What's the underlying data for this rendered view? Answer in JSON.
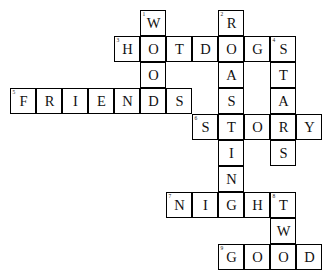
{
  "puzzle": {
    "title": "Crossword Puzzle Grid",
    "cell_size": 26,
    "origin_x": 10,
    "origin_y": 10,
    "columns": 12,
    "rows": 10,
    "colors": {
      "grid_line": "#000000",
      "cell_fill": "#ffffff",
      "letter": "#111111",
      "background": "#ffffff"
    },
    "cells": [
      {
        "row": 0,
        "col": 5,
        "letter": "W",
        "number": "1"
      },
      {
        "row": 0,
        "col": 8,
        "letter": "R",
        "number": "2"
      },
      {
        "row": 1,
        "col": 4,
        "letter": "H",
        "number": "3"
      },
      {
        "row": 1,
        "col": 5,
        "letter": "O",
        "number": ""
      },
      {
        "row": 1,
        "col": 6,
        "letter": "T",
        "number": ""
      },
      {
        "row": 1,
        "col": 7,
        "letter": "D",
        "number": ""
      },
      {
        "row": 1,
        "col": 8,
        "letter": "O",
        "number": ""
      },
      {
        "row": 1,
        "col": 9,
        "letter": "G",
        "number": ""
      },
      {
        "row": 1,
        "col": 10,
        "letter": "S",
        "number": "4"
      },
      {
        "row": 2,
        "col": 5,
        "letter": "O",
        "number": ""
      },
      {
        "row": 2,
        "col": 8,
        "letter": "A",
        "number": ""
      },
      {
        "row": 2,
        "col": 10,
        "letter": "T",
        "number": ""
      },
      {
        "row": 3,
        "col": 0,
        "letter": "F",
        "number": "5"
      },
      {
        "row": 3,
        "col": 1,
        "letter": "R",
        "number": ""
      },
      {
        "row": 3,
        "col": 2,
        "letter": "I",
        "number": ""
      },
      {
        "row": 3,
        "col": 3,
        "letter": "E",
        "number": ""
      },
      {
        "row": 3,
        "col": 4,
        "letter": "N",
        "number": ""
      },
      {
        "row": 3,
        "col": 5,
        "letter": "D",
        "number": ""
      },
      {
        "row": 3,
        "col": 6,
        "letter": "S",
        "number": ""
      },
      {
        "row": 3,
        "col": 8,
        "letter": "S",
        "number": ""
      },
      {
        "row": 3,
        "col": 10,
        "letter": "A",
        "number": ""
      },
      {
        "row": 4,
        "col": 7,
        "letter": "S",
        "number": "6"
      },
      {
        "row": 4,
        "col": 8,
        "letter": "T",
        "number": ""
      },
      {
        "row": 4,
        "col": 9,
        "letter": "O",
        "number": ""
      },
      {
        "row": 4,
        "col": 10,
        "letter": "R",
        "number": ""
      },
      {
        "row": 4,
        "col": 11,
        "letter": "Y",
        "number": ""
      },
      {
        "row": 5,
        "col": 8,
        "letter": "I",
        "number": ""
      },
      {
        "row": 5,
        "col": 10,
        "letter": "S",
        "number": ""
      },
      {
        "row": 6,
        "col": 8,
        "letter": "N",
        "number": ""
      },
      {
        "row": 7,
        "col": 6,
        "letter": "N",
        "number": "7"
      },
      {
        "row": 7,
        "col": 7,
        "letter": "I",
        "number": ""
      },
      {
        "row": 7,
        "col": 8,
        "letter": "G",
        "number": ""
      },
      {
        "row": 7,
        "col": 9,
        "letter": "H",
        "number": ""
      },
      {
        "row": 7,
        "col": 10,
        "letter": "T",
        "number": "8"
      },
      {
        "row": 8,
        "col": 10,
        "letter": "W",
        "number": ""
      },
      {
        "row": 9,
        "col": 8,
        "letter": "G",
        "number": "9"
      },
      {
        "row": 9,
        "col": 9,
        "letter": "O",
        "number": ""
      },
      {
        "row": 9,
        "col": 10,
        "letter": "O",
        "number": ""
      },
      {
        "row": 9,
        "col": 11,
        "letter": "D",
        "number": ""
      }
    ],
    "words": {
      "across": [
        {
          "number": "3",
          "answer": "HOTDOGS",
          "row": 1,
          "col": 4
        },
        {
          "number": "5",
          "answer": "FRIENDS",
          "row": 3,
          "col": 0
        },
        {
          "number": "6",
          "answer": "STORY",
          "row": 4,
          "col": 7
        },
        {
          "number": "7",
          "answer": "NIGHT",
          "row": 7,
          "col": 6
        },
        {
          "number": "9",
          "answer": "GOOD",
          "row": 9,
          "col": 8
        }
      ],
      "down": [
        {
          "number": "1",
          "answer": "WOODS",
          "row": 0,
          "col": 5
        },
        {
          "number": "2",
          "answer": "ROASTING",
          "row": 0,
          "col": 8
        },
        {
          "number": "4",
          "answer": "STARS",
          "row": 1,
          "col": 10
        },
        {
          "number": "8",
          "answer": "TWO",
          "row": 7,
          "col": 10
        }
      ]
    }
  }
}
